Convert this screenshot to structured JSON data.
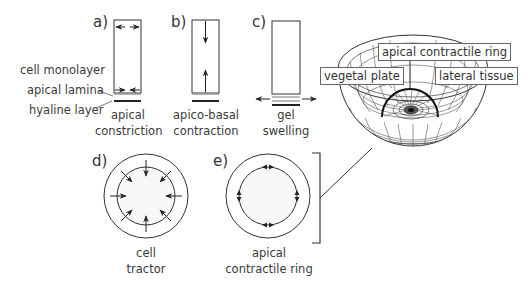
{
  "panels": {
    "a": {
      "letter": "a)",
      "caption_line1": "apical",
      "caption_line2": "constriction"
    },
    "b": {
      "letter": "b)",
      "caption_line1": "apico-basal",
      "caption_line2": "contraction"
    },
    "c": {
      "letter": "c)",
      "caption_line1": "gel",
      "caption_line2": "swelling"
    },
    "d": {
      "letter": "d)",
      "caption_line1": "cell",
      "caption_line2": "tractor"
    },
    "e": {
      "letter": "e)",
      "caption_line1": "apical",
      "caption_line2": "contractile ring"
    }
  },
  "layer_labels": {
    "cell_monolayer": "cell monolayer",
    "apical_lamina": "apical lamina",
    "hyaline_layer": "hyaline layer"
  },
  "embryo_labels": {
    "apical_ring": "apical contractile ring",
    "vegetal_plate": "vegetal plate",
    "lateral_tissue": "lateral tissue"
  },
  "colors": {
    "line": "#2a2a2a",
    "gray_layer": "#9a9a9a",
    "text": "#3a3a3a"
  }
}
